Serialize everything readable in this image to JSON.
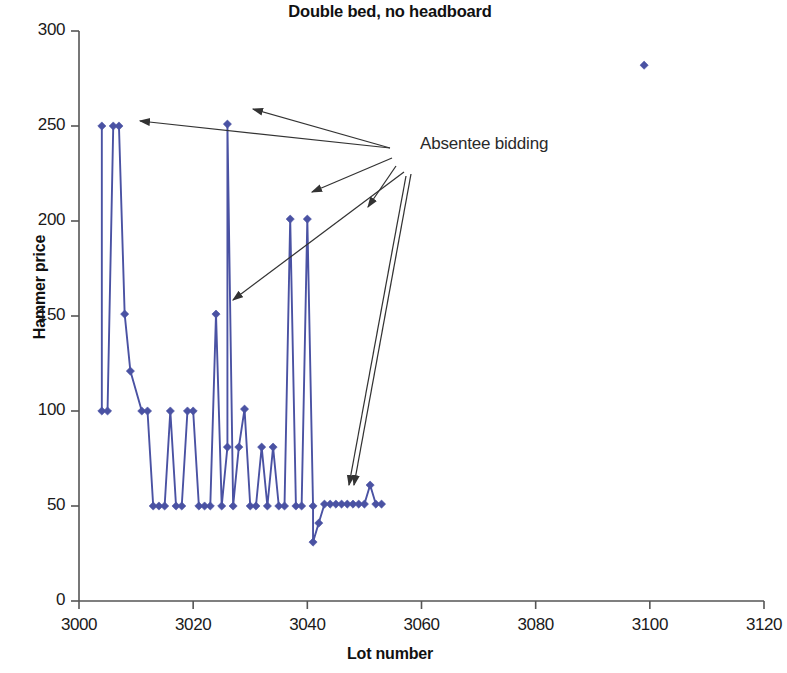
{
  "chart_data": {
    "type": "line",
    "title": "Double bed, no headboard",
    "xlabel": "Lot number",
    "ylabel": "Hammer price",
    "xlim": [
      3000,
      3120
    ],
    "ylim": [
      0,
      300
    ],
    "xticks": [
      3000,
      3020,
      3040,
      3060,
      3080,
      3100,
      3120
    ],
    "yticks": [
      0,
      50,
      100,
      150,
      200,
      250,
      300
    ],
    "grid": false,
    "legend": null,
    "marker": "diamond",
    "series_color": "#4a52a3",
    "series": [
      {
        "name": "Hammer price by lot",
        "connected": true,
        "points": [
          [
            3004,
            250
          ],
          [
            3004,
            100
          ],
          [
            3005,
            100
          ],
          [
            3006,
            250
          ],
          [
            3007,
            250
          ],
          [
            3008,
            151
          ],
          [
            3009,
            121
          ],
          [
            3011,
            100
          ],
          [
            3012,
            100
          ],
          [
            3013,
            50
          ],
          [
            3014,
            50
          ],
          [
            3015,
            50
          ],
          [
            3016,
            100
          ],
          [
            3017,
            50
          ],
          [
            3018,
            50
          ],
          [
            3019,
            100
          ],
          [
            3020,
            100
          ],
          [
            3021,
            50
          ],
          [
            3022,
            50
          ],
          [
            3023,
            50
          ],
          [
            3024,
            151
          ],
          [
            3025,
            50
          ],
          [
            3026,
            81
          ],
          [
            3026,
            251
          ],
          [
            3027,
            50
          ],
          [
            3028,
            81
          ],
          [
            3029,
            101
          ],
          [
            3030,
            50
          ],
          [
            3031,
            50
          ],
          [
            3032,
            81
          ],
          [
            3033,
            50
          ],
          [
            3034,
            81
          ],
          [
            3035,
            50
          ],
          [
            3036,
            50
          ],
          [
            3037,
            201
          ],
          [
            3038,
            50
          ],
          [
            3039,
            50
          ],
          [
            3040,
            201
          ],
          [
            3041,
            50
          ],
          [
            3041,
            31
          ],
          [
            3042,
            41
          ],
          [
            3043,
            51
          ],
          [
            3044,
            51
          ],
          [
            3045,
            51
          ],
          [
            3046,
            51
          ],
          [
            3047,
            51
          ],
          [
            3048,
            51
          ],
          [
            3049,
            51
          ],
          [
            3050,
            51
          ],
          [
            3051,
            61
          ],
          [
            3052,
            51
          ],
          [
            3053,
            51
          ]
        ]
      },
      {
        "name": "Outlier lot",
        "connected": false,
        "points": [
          [
            3099,
            282
          ]
        ]
      }
    ],
    "annotations": [
      {
        "label": "Absentee bidding",
        "text_x": 420,
        "text_y": 134,
        "arrow_targets": [
          "lot 3007 at 250",
          "lot 3026 at 251",
          "lot 3037 at 201",
          "lot 3040 at 201",
          "lot 3047 at 51",
          "lot 3048 at 51"
        ]
      }
    ]
  }
}
